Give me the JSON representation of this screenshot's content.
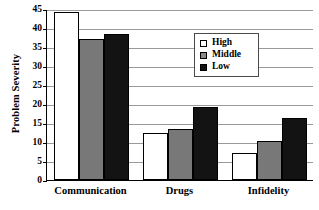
{
  "chart_data": {
    "type": "bar",
    "title": "",
    "xlabel": "",
    "ylabel": "Problem Severity",
    "categories": [
      "Communication",
      "Drugs",
      "Infidelity"
    ],
    "series": [
      {
        "name": "High",
        "color": "#ffffff",
        "values": [
          44.3,
          12.3,
          7.2
        ]
      },
      {
        "name": "Middle",
        "color": "#787878",
        "values": [
          37.2,
          13.3,
          10.3
        ]
      },
      {
        "name": "Low",
        "color": "#131313",
        "values": [
          38.3,
          19.2,
          16.2
        ]
      }
    ],
    "ylim": [
      0,
      45
    ],
    "yticks": [
      0,
      5,
      10,
      15,
      20,
      25,
      30,
      35,
      40,
      45
    ],
    "ytick_labels": [
      "0",
      "5",
      "10",
      "15",
      "20",
      "25",
      "30",
      "35",
      "40",
      "45"
    ],
    "grid": "horizontal",
    "legend_position": "upper-right-inside",
    "legend_entries": [
      "High",
      "Middle",
      "Low"
    ]
  },
  "axis": {
    "y_title": "Problem Severity"
  }
}
